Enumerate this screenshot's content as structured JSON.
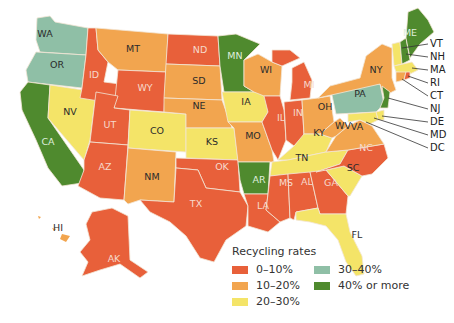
{
  "map": {
    "type": "choropleth",
    "region": "United States",
    "legend": {
      "title": "Recycling rates",
      "categories": [
        {
          "label": "0–10%",
          "color": "#e8603a"
        },
        {
          "label": "10–20%",
          "color": "#f2a54f"
        },
        {
          "label": "20–30%",
          "color": "#f4e468"
        },
        {
          "label": "30–40%",
          "color": "#8fbfa6"
        },
        {
          "label": "40% or more",
          "color": "#4f8a2e"
        }
      ]
    },
    "states": {
      "WA": "30–40%",
      "OR": "30–40%",
      "CA": "40% or more",
      "NV": "20–30%",
      "ID": "0–10%",
      "MT": "10–20%",
      "WY": "0–10%",
      "UT": "0–10%",
      "AZ": "0–10%",
      "CO": "20–30%",
      "NM": "10–20%",
      "ND": "0–10%",
      "SD": "10–20%",
      "NE": "10–20%",
      "KS": "20–30%",
      "OK": "0–10%",
      "TX": "0–10%",
      "MN": "40% or more",
      "IA": "20–30%",
      "MO": "10–20%",
      "AR": "40% or more",
      "LA": "0–10%",
      "WI": "10–20%",
      "IL": "0–10%",
      "MI": "0–10%",
      "IN": "0–10%",
      "OH": "10–20%",
      "KY": "20–30%",
      "TN": "20–30%",
      "MS": "0–10%",
      "AL": "0–10%",
      "GA": "0–10%",
      "FL": "20–30%",
      "SC": "20–30%",
      "NC": "0–10%",
      "VA": "10–20%",
      "WV": "10–20%",
      "PA": "30–40%",
      "NY": "10–20%",
      "ME": "40% or more",
      "VT": "20–30%",
      "NH": "40% or more",
      "MA": "20–30%",
      "RI": "0–10%",
      "CT": "10–20%",
      "NJ": "40% or more",
      "DE": "20–30%",
      "MD": "20–30%",
      "DC": "20–30%",
      "AK": "0–10%",
      "HI": "10–20%"
    },
    "labels": [
      "WA",
      "OR",
      "CA",
      "NV",
      "ID",
      "MT",
      "WY",
      "UT",
      "AZ",
      "CO",
      "NM",
      "ND",
      "SD",
      "NE",
      "KS",
      "OK",
      "TX",
      "MN",
      "IA",
      "MO",
      "AR",
      "LA",
      "WI",
      "IL",
      "MI",
      "IN",
      "OH",
      "KY",
      "TN",
      "MS",
      "AL",
      "GA",
      "FL",
      "SC",
      "NC",
      "VA",
      "WV",
      "PA",
      "NY",
      "ME",
      "AK",
      "HI"
    ],
    "callouts": [
      "VT",
      "NH",
      "MA",
      "RI",
      "CT",
      "NJ",
      "DE",
      "MD",
      "DC"
    ]
  }
}
